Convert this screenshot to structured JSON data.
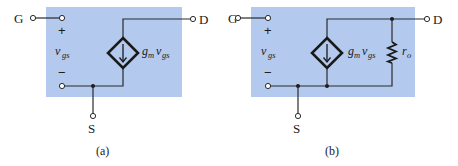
{
  "figure": {
    "panels": [
      {
        "id": "a",
        "caption": "(a)",
        "terminals": {
          "gate": "G",
          "drain": "D",
          "source": "S"
        },
        "vgs": {
          "plus": "+",
          "minus": "−",
          "symbol": "v",
          "subscript": "gs"
        },
        "current_source": {
          "coef": "g",
          "coef_sub": "m",
          "var": "v",
          "var_sub": "gs",
          "icon": "dependent-current-source-icon"
        }
      },
      {
        "id": "b",
        "caption": "(b)",
        "terminals": {
          "gate": "G",
          "drain": "D",
          "source": "S"
        },
        "vgs": {
          "plus": "+",
          "minus": "−",
          "symbol": "v",
          "subscript": "gs"
        },
        "current_source": {
          "coef": "g",
          "coef_sub": "m",
          "var": "v",
          "var_sub": "gs",
          "icon": "dependent-current-source-icon"
        },
        "resistor": {
          "symbol": "r",
          "subscript": "o",
          "icon": "resistor-icon"
        }
      }
    ],
    "colors": {
      "box": "#b4c9ee",
      "wire": "#2a2a2a"
    }
  }
}
